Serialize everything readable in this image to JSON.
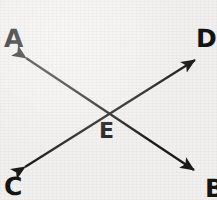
{
  "figure": {
    "width": 217,
    "height": 200,
    "background_color": "#f1f0ee",
    "stroke_color": "#1a1a1a",
    "stroke_width": 2.2
  },
  "labels": {
    "a": "A",
    "b": "B",
    "c": "C",
    "d": "D",
    "e": "E"
  },
  "geometry": {
    "intersection": {
      "x": 110,
      "y": 114
    },
    "segments": [
      {
        "name": "segment-A-B",
        "from_label": "A",
        "to_label": "B",
        "from": {
          "x": 22,
          "y": 55
        },
        "to": {
          "x": 198,
          "y": 173
        },
        "arrowheads": "both"
      },
      {
        "name": "segment-C-D",
        "from_label": "C",
        "to_label": "D",
        "from": {
          "x": 21,
          "y": 170
        },
        "to": {
          "x": 199,
          "y": 57
        },
        "arrowheads": "both"
      }
    ],
    "label_positions": {
      "a": {
        "x": 4,
        "y": 26
      },
      "d": {
        "x": 196,
        "y": 26
      },
      "c": {
        "x": 4,
        "y": 174
      },
      "b": {
        "x": 205,
        "y": 176
      },
      "e": {
        "x": 99,
        "y": 120
      }
    }
  }
}
